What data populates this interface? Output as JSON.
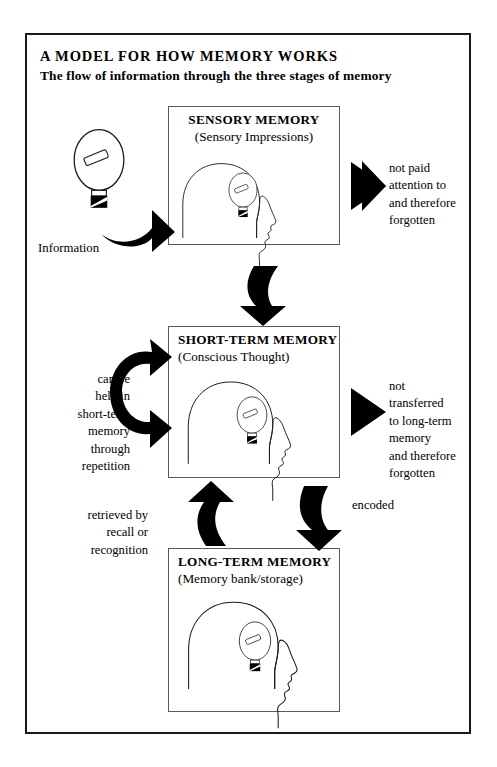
{
  "document": {
    "title": "A MODEL FOR HOW MEMORY WORKS",
    "subtitle": "The flow of information through the three stages of memory"
  },
  "stages": [
    {
      "id": "sensory-memory",
      "title": "SENSORY MEMORY",
      "subtitle": "(Sensory Impressions)",
      "icon": "head-with-lightbulb-icon"
    },
    {
      "id": "short-term-memory",
      "title": "SHORT-TERM MEMORY",
      "subtitle": "(Conscious Thought)",
      "icon": "head-with-lightbulb-icon"
    },
    {
      "id": "long-term-memory",
      "title": "LONG-TERM MEMORY",
      "subtitle": "(Memory bank/storage)",
      "icon": "head-with-lightbulb-icon"
    }
  ],
  "labels": {
    "information": "Information",
    "loss_sensory": "not paid\nattention to\nand therefore\nforgotten",
    "loss_short_term": "not\ntransferred\nto long-term\nmemory\nand therefore\nforgotten",
    "rehearsal": "can be\nheld in\nshort-term\nmemory\nthrough\nrepetition",
    "retrieval": "retrieved by\nrecall or\nrecognition",
    "encoding": "encoded"
  },
  "arrows": [
    {
      "name": "information-input-arrow",
      "shape": "curved-up-right"
    },
    {
      "name": "sensory-loss-arrow",
      "shape": "straight-right"
    },
    {
      "name": "sensory-to-short-term-arrow",
      "shape": "curved-down"
    },
    {
      "name": "rehearsal-loop-arrow",
      "shape": "c-loop-double-headed"
    },
    {
      "name": "short-term-loss-arrow",
      "shape": "straight-right"
    },
    {
      "name": "encoding-arrow",
      "shape": "curved-down"
    },
    {
      "name": "retrieval-arrow",
      "shape": "curved-up"
    }
  ],
  "colors": {
    "ink": "#000000",
    "frame": "#1a1a1a",
    "box_border": "#5a5a5a",
    "background": "#ffffff"
  }
}
